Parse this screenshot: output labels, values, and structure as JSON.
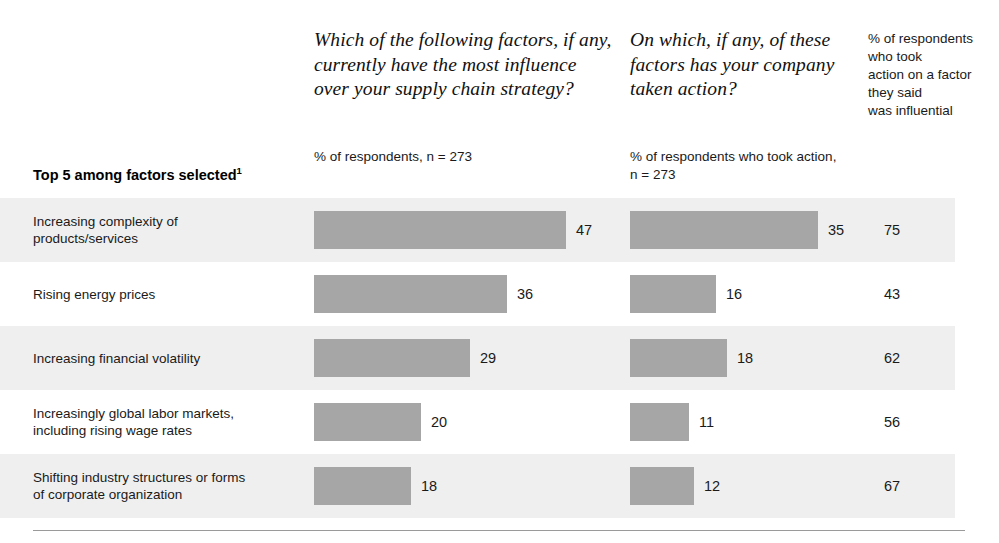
{
  "header": {
    "row_group_title": "Top 5 among factors selected",
    "row_group_title_footnote": "1",
    "question_1": "Which of the following factors, if any, currently have the most influence over your supply chain strategy?",
    "question_1_note": "% of respondents, n = 273",
    "question_2": "On which, if any, of these factors has your company taken action?",
    "question_2_note": "% of respondents who took action, n = 273",
    "column_3_heading_lines": [
      "% of respondents",
      "who took",
      "action on a factor",
      "they said",
      "was influential"
    ]
  },
  "colors": {
    "bar": "#a6a6a6",
    "row_shaded": "#efefef",
    "rule": "#9a9a9a",
    "text": "#1a1a1a"
  },
  "chart_data": {
    "type": "bar",
    "title": "Which of the following factors, if any, currently have the most influence over your supply chain strategy?",
    "subtitle": "Top 5 among factors selected",
    "xlabel": "",
    "ylabel": "",
    "grid": false,
    "orientation": "horizontal",
    "axis_max": 50,
    "legend_position": "none",
    "categories": [
      "Increasing complexity of products/services",
      "Rising energy prices",
      "Increasing financial volatility",
      "Increasingly global labor markets, including rising wage rates",
      "Shifting industry structures or forms of corporate organization"
    ],
    "series": [
      {
        "name": "% of respondents, n = 273",
        "question": "Which of the following factors, if any, currently have the most influence over your supply chain strategy?",
        "values": [
          47,
          36,
          29,
          20,
          18
        ]
      },
      {
        "name": "% of respondents who took action, n = 273",
        "question": "On which, if any, of these factors has your company taken action?",
        "values": [
          35,
          16,
          18,
          11,
          12
        ]
      },
      {
        "name": "% of respondents who took action on a factor they said was influential",
        "question": "% of respondents who took action on a factor they said was influential",
        "values": [
          75,
          43,
          62,
          56,
          67
        ],
        "rendered_as": "text"
      }
    ]
  },
  "rows": [
    {
      "label_line1": "Increasing complexity of",
      "label_line2": "products/services",
      "value1": "47",
      "value2": "35",
      "value3": "75",
      "bar1_width": 252,
      "bar2_width": 188,
      "shaded": true
    },
    {
      "label_line1": "Rising energy prices",
      "label_line2": "",
      "value1": "36",
      "value2": "16",
      "value3": "43",
      "bar1_width": 193,
      "bar2_width": 86,
      "shaded": false
    },
    {
      "label_line1": "Increasing financial volatility",
      "label_line2": "",
      "value1": "29",
      "value2": "18",
      "value3": "62",
      "bar1_width": 156,
      "bar2_width": 97,
      "shaded": true
    },
    {
      "label_line1": "Increasingly global labor markets,",
      "label_line2": "including rising wage rates",
      "value1": "20",
      "value2": "11",
      "value3": "56",
      "bar1_width": 107,
      "bar2_width": 59,
      "shaded": false
    },
    {
      "label_line1": "Shifting industry structures or forms",
      "label_line2": "of corporate organization",
      "value1": "18",
      "value2": "12",
      "value3": "67",
      "bar1_width": 97,
      "bar2_width": 64,
      "shaded": true
    }
  ]
}
